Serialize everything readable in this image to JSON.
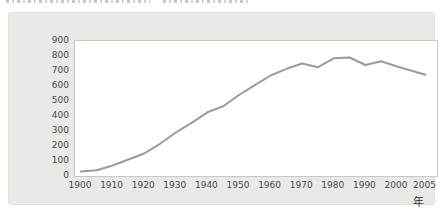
{
  "window": {
    "width": 443,
    "height": 216
  },
  "colors": {
    "page_bg": "#ffffff",
    "panel_bg": "#e9e9e6",
    "plot_bg": "#ffffff",
    "plot_border": "#c8c8c6",
    "line": "#9b9b9b",
    "tick_label": "#4a4a4a",
    "unit_label": "#333333",
    "caption_fragment": "#b9b9b9"
  },
  "top_caption": {
    "truncated": true,
    "legible_text": ""
  },
  "labels": {
    "x_unit": "年"
  },
  "chart_data": {
    "type": "line",
    "title": "",
    "xlabel": "年",
    "ylabel": "",
    "x": [
      1900,
      1905,
      1910,
      1915,
      1920,
      1925,
      1930,
      1935,
      1940,
      1945,
      1950,
      1955,
      1960,
      1965,
      1970,
      1975,
      1980,
      1985,
      1990,
      1995,
      2000,
      2005
    ],
    "values": [
      30,
      38,
      70,
      110,
      150,
      215,
      290,
      355,
      425,
      465,
      540,
      605,
      670,
      715,
      750,
      725,
      785,
      790,
      740,
      765,
      730,
      675
    ],
    "ylim": [
      0,
      900
    ],
    "yticks": [
      0,
      100,
      200,
      300,
      400,
      500,
      600,
      700,
      800,
      900
    ],
    "xticks": [
      1900,
      1910,
      1920,
      1930,
      1940,
      1950,
      1960,
      1970,
      1980,
      1990,
      2000,
      2005
    ],
    "grid": false,
    "legend": "none",
    "line_color": "#9b9b9b",
    "line_width": 2
  }
}
